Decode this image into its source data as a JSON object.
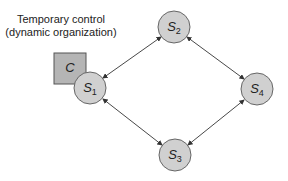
{
  "caption": {
    "line1": "Temporary control",
    "line2": "(dynamic organization)"
  },
  "controller": {
    "label": "C",
    "fill": "#b5b5b5",
    "stroke": "#555555"
  },
  "nodes": [
    {
      "id": "S1",
      "base": "S",
      "sub": "1",
      "cx": 90,
      "cy": 88
    },
    {
      "id": "S2",
      "base": "S",
      "sub": "2",
      "cx": 174,
      "cy": 27
    },
    {
      "id": "S3",
      "base": "S",
      "sub": "3",
      "cx": 175,
      "cy": 155
    },
    {
      "id": "S4",
      "base": "S",
      "sub": "4",
      "cx": 257,
      "cy": 89
    }
  ],
  "edges": [
    {
      "from": "S1",
      "to": "S2",
      "type": "bidirectional"
    },
    {
      "from": "S2",
      "to": "S4",
      "type": "bidirectional"
    },
    {
      "from": "S1",
      "to": "S3",
      "type": "bidirectional"
    },
    {
      "from": "S3",
      "to": "S4",
      "type": "bidirectional"
    }
  ],
  "colors": {
    "node_fill": "#d0d0d0",
    "node_stroke": "#666666",
    "edge": "#333333"
  }
}
